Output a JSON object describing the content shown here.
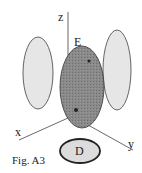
{
  "figure": {
    "caption": "Fig. A3",
    "labels": {
      "z": "z",
      "x": "x",
      "y": "y",
      "ellipsoid": "E",
      "disk": "D"
    },
    "colors": {
      "ellipsoid_fill": "#8a8a8a",
      "ellipsoid_stroke": "#444444",
      "projection_fill": "#e6e6e6",
      "projection_stroke": "#555555",
      "disk_fill": "#dcdcdc",
      "disk_stroke": "#222222",
      "axis": "#444444"
    }
  }
}
